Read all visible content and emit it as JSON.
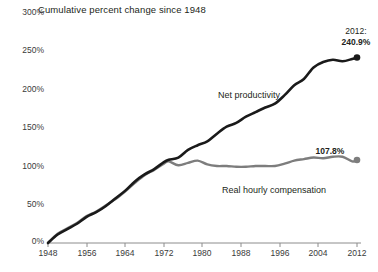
{
  "chart_data": {
    "type": "line",
    "title": "Cumulative percent change since 1948",
    "xlabel": "",
    "ylabel": "",
    "xlim": [
      1948,
      2012
    ],
    "ylim": [
      0,
      300
    ],
    "grid": false,
    "legend_position": "inline-annotations",
    "x_ticks": [
      "1948",
      "1956",
      "1964",
      "1972",
      "1980",
      "1988",
      "1996",
      "2004",
      "2012"
    ],
    "y_ticks": [
      "0%",
      "50%",
      "100%",
      "150%",
      "200%",
      "250%",
      "300%"
    ],
    "x": [
      1948,
      1950,
      1952,
      1954,
      1956,
      1958,
      1960,
      1962,
      1964,
      1966,
      1968,
      1970,
      1972,
      1973,
      1975,
      1977,
      1979,
      1981,
      1983,
      1985,
      1987,
      1989,
      1991,
      1993,
      1995,
      1997,
      1999,
      2001,
      2003,
      2005,
      2007,
      2009,
      2011,
      2012
    ],
    "series": [
      {
        "name": "Net productivity",
        "color": "#1a1a1a",
        "end_value": 240.9,
        "end_label": "240.9%",
        "end_year": "2012",
        "values": [
          0,
          11,
          18,
          25,
          34,
          40,
          48,
          58,
          68,
          80,
          89,
          96,
          105,
          108,
          111,
          121,
          127,
          132,
          142,
          151,
          156,
          164,
          170,
          176,
          181,
          192,
          205,
          213,
          228,
          235,
          238,
          236,
          239,
          240.9
        ]
      },
      {
        "name": "Real hourly compensation",
        "color": "#7d7d7d",
        "end_value": 107.8,
        "end_label": "107.8%",
        "end_year": "",
        "values": [
          0,
          12,
          19,
          26,
          35,
          41,
          49,
          57,
          67,
          78,
          88,
          95,
          103,
          106,
          101,
          104,
          107,
          102,
          100,
          100,
          99,
          99,
          100,
          100,
          100,
          103,
          107,
          109,
          111,
          110,
          112,
          112,
          106,
          107.8
        ]
      }
    ],
    "annotations": [
      {
        "text": "Net productivity",
        "series": "Net productivity"
      },
      {
        "text": "Real hourly compensation",
        "series": "Real hourly compensation"
      }
    ]
  },
  "axis": {
    "y_labels": [
      {
        "text": "300%",
        "top": 7
      },
      {
        "text": "250%",
        "top": 45
      },
      {
        "text": "200%",
        "top": 84
      },
      {
        "text": "150%",
        "top": 122
      },
      {
        "text": "100%",
        "top": 161
      },
      {
        "text": "50%",
        "top": 199
      },
      {
        "text": "0%",
        "top": 236
      }
    ],
    "x_labels": [
      {
        "text": "1948",
        "left": 48
      },
      {
        "text": "1956",
        "left": 87
      },
      {
        "text": "1964",
        "left": 125
      },
      {
        "text": "1972",
        "left": 164
      },
      {
        "text": "1980",
        "left": 202
      },
      {
        "text": "1988",
        "left": 241
      },
      {
        "text": "1996",
        "left": 280
      },
      {
        "text": "2004",
        "left": 318
      },
      {
        "text": "2012",
        "left": 357
      }
    ]
  },
  "labels": {
    "title": "Cumulative percent change since 1948",
    "productivity_series": "Net productivity",
    "compensation_series": "Real hourly compensation",
    "productivity_end_year": "2012:",
    "productivity_end_value": "240.9%",
    "compensation_end_value": "107.8%"
  },
  "colors": {
    "productivity_line": "#1a1a1a",
    "compensation_line": "#7d7d7d",
    "axis": "#8c8c8c",
    "text": "#231f20",
    "background": "#ffffff"
  }
}
